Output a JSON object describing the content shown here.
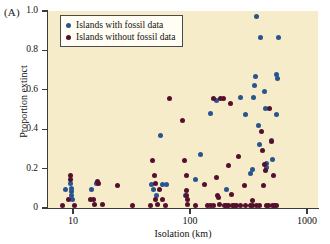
{
  "panel": {
    "label": "(A)"
  },
  "colors": {
    "with_fossil": "#28548f",
    "without_fossil": "#55102e",
    "plot_background": "#f6ecc9",
    "axis": "#3b3b3b"
  },
  "legend": {
    "entries": [
      {
        "label": "Islands with fossil data",
        "color_key": "with_fossil"
      },
      {
        "label": "Islands without fossil data",
        "color_key": "without_fossil"
      }
    ]
  },
  "axes": {
    "y": {
      "label": "Proportion extinct",
      "ticks": [
        "1.0",
        "0.8",
        "0.6",
        "0.4",
        "0.2",
        "0"
      ],
      "tick_values": [
        1.0,
        0.8,
        0.6,
        0.4,
        0.2,
        0
      ],
      "range": [
        0,
        1.0
      ]
    },
    "x": {
      "label": "Isolation (km)",
      "ticks": [
        "10",
        "100",
        "1000"
      ],
      "tick_values": [
        10,
        100,
        1000
      ],
      "scale": "log",
      "range": [
        8,
        1000
      ]
    }
  },
  "chart_data": {
    "type": "scatter",
    "title": "",
    "xlabel": "Isolation (km)",
    "ylabel": "Proportion extinct",
    "xscale": "log",
    "xlim": [
      8,
      1000
    ],
    "ylim": [
      0,
      1.0
    ],
    "grid": false,
    "legend_position": "top-left",
    "series": [
      {
        "name": "Islands with fossil data",
        "color": "#28548f",
        "points": [
          [
            8.6,
            0.095
          ],
          [
            9.6,
            0.125
          ],
          [
            9.7,
            0.1
          ],
          [
            9.8,
            0.085
          ],
          [
            9.8,
            0.065
          ],
          [
            9.9,
            0.045
          ],
          [
            14.5,
            0.095
          ],
          [
            16.0,
            0.125
          ],
          [
            47.0,
            0.12
          ],
          [
            48.5,
            0.095
          ],
          [
            52.0,
            0.065
          ],
          [
            56.0,
            0.37
          ],
          [
            58.0,
            0.12
          ],
          [
            63.0,
            0.12
          ],
          [
            92.0,
            0.065
          ],
          [
            112.0,
            0.145
          ],
          [
            124.0,
            0.27
          ],
          [
            150.0,
            0.48
          ],
          [
            168.0,
            0.545
          ],
          [
            205.0,
            0.095
          ],
          [
            272.0,
            0.56
          ],
          [
            300.0,
            0.475
          ],
          [
            330.0,
            0.175
          ],
          [
            340.0,
            0.195
          ],
          [
            352.0,
            0.56
          ],
          [
            358.0,
            0.62
          ],
          [
            362.0,
            0.665
          ],
          [
            368.0,
            0.97
          ],
          [
            382.0,
            0.42
          ],
          [
            392.0,
            0.32
          ],
          [
            402.0,
            0.865
          ],
          [
            430.0,
            0.59
          ],
          [
            442.0,
            0.505
          ],
          [
            448.0,
            0.225
          ],
          [
            452.0,
            0.205
          ],
          [
            495.0,
            0.345
          ],
          [
            512.0,
            0.245
          ],
          [
            545.0,
            0.475
          ],
          [
            552.0,
            0.68
          ],
          [
            556.0,
            0.655
          ],
          [
            570.0,
            0.865
          ]
        ]
      },
      {
        "name": "Islands without fossil data",
        "color": "#55102e",
        "points": [
          [
            8.2,
            0.015
          ],
          [
            9.2,
            0.045
          ],
          [
            9.5,
            0.165
          ],
          [
            9.6,
            0.145
          ],
          [
            10.4,
            0.015
          ],
          [
            14.2,
            0.045
          ],
          [
            15.0,
            0.045
          ],
          [
            15.2,
            0.02
          ],
          [
            16.2,
            0.135
          ],
          [
            16.5,
            0.125
          ],
          [
            17.8,
            0.02
          ],
          [
            24.0,
            0.115
          ],
          [
            32.0,
            0.015
          ],
          [
            46.0,
            0.015
          ],
          [
            48.0,
            0.24
          ],
          [
            49.5,
            0.165
          ],
          [
            50.5,
            0.125
          ],
          [
            51.0,
            0.045
          ],
          [
            52.5,
            0.02
          ],
          [
            55.0,
            0.095
          ],
          [
            58.5,
            0.045
          ],
          [
            62.0,
            0.015
          ],
          [
            67.0,
            0.555
          ],
          [
            86.0,
            0.445
          ],
          [
            90.0,
            0.24
          ],
          [
            92.5,
            0.165
          ],
          [
            93.0,
            0.09
          ],
          [
            94.0,
            0.065
          ],
          [
            95.0,
            0.045
          ],
          [
            96.0,
            0.02
          ],
          [
            112.0,
            0.015
          ],
          [
            134.0,
            0.12
          ],
          [
            140.0,
            0.015
          ],
          [
            150.0,
            0.015
          ],
          [
            158.0,
            0.555
          ],
          [
            160.0,
            0.015
          ],
          [
            168.0,
            0.155
          ],
          [
            172.0,
            0.065
          ],
          [
            175.0,
            0.055
          ],
          [
            178.0,
            0.02
          ],
          [
            182.0,
            0.555
          ],
          [
            192.0,
            0.555
          ],
          [
            196.0,
            0.015
          ],
          [
            205.0,
            0.015
          ],
          [
            212.0,
            0.215
          ],
          [
            215.0,
            0.015
          ],
          [
            222.0,
            0.53
          ],
          [
            226.0,
            0.07
          ],
          [
            232.0,
            0.015
          ],
          [
            240.0,
            0.015
          ],
          [
            250.0,
            0.015
          ],
          [
            262.0,
            0.26
          ],
          [
            268.0,
            0.015
          ],
          [
            290.0,
            0.115
          ],
          [
            300.0,
            0.015
          ],
          [
            330.0,
            0.015
          ],
          [
            340.0,
            0.015
          ],
          [
            342.0,
            0.04
          ],
          [
            372.0,
            0.015
          ],
          [
            390.0,
            0.015
          ],
          [
            410.0,
            0.39
          ],
          [
            418.0,
            0.29
          ],
          [
            428.0,
            0.115
          ],
          [
            432.0,
            0.22
          ],
          [
            438.0,
            0.19
          ],
          [
            452.0,
            0.015
          ],
          [
            470.0,
            0.015
          ],
          [
            478.0,
            0.505
          ],
          [
            495.0,
            0.34
          ],
          [
            510.0,
            0.015
          ],
          [
            522.0,
            0.165
          ],
          [
            532.0,
            0.015
          ],
          [
            548.0,
            0.015
          ]
        ]
      }
    ]
  }
}
